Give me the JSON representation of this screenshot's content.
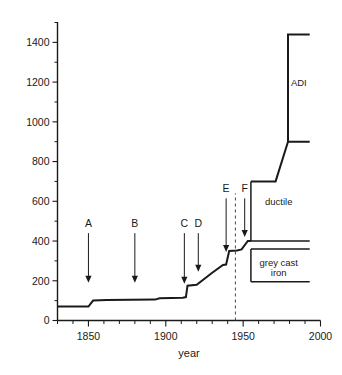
{
  "chart_data": {
    "type": "line",
    "title": "",
    "xlabel": "year",
    "ylabel": "",
    "xlim": [
      1830,
      2000
    ],
    "ylim": [
      0,
      1500
    ],
    "grid": false,
    "legend": "none",
    "x_ticks_major": [
      1850,
      1900,
      1950,
      2000
    ],
    "x_tick_labels": [
      "1850",
      "1900",
      "1950",
      "2000"
    ],
    "x_tick_minor_step": 10,
    "y_ticks_major": [
      0,
      200,
      400,
      600,
      800,
      1000,
      1200,
      1400
    ],
    "y_tick_labels": [
      "0",
      "200",
      "400",
      "600",
      "800",
      "1000",
      "1200",
      "1400"
    ],
    "y_tick_minor_step": 100,
    "series": [
      {
        "name": "tensile strength envelope",
        "points": [
          [
            1830,
            70
          ],
          [
            1850,
            70
          ],
          [
            1853,
            100
          ],
          [
            1862,
            103
          ],
          [
            1893,
            105
          ],
          [
            1896,
            112
          ],
          [
            1911,
            115
          ],
          [
            1913,
            118
          ],
          [
            1914,
            175
          ],
          [
            1920,
            180
          ],
          [
            1930,
            240
          ],
          [
            1937,
            280
          ],
          [
            1939,
            282
          ],
          [
            1941,
            350
          ],
          [
            1946,
            353
          ],
          [
            1949,
            358
          ],
          [
            1953,
            400
          ],
          [
            1955,
            400
          ]
        ]
      },
      {
        "name": "ductile upper bound",
        "points": [
          [
            1955,
            700
          ],
          [
            1971,
            700
          ],
          [
            1979,
            900
          ],
          [
            1993,
            900
          ]
        ]
      },
      {
        "name": "adi bound",
        "points": [
          [
            1979,
            900
          ],
          [
            1979,
            1440
          ],
          [
            1993,
            1440
          ]
        ]
      }
    ],
    "regions": [
      {
        "label": "ductile",
        "x": 1973,
        "y": 600
      },
      {
        "label": "grey  cast",
        "x": 1973,
        "y": 290
      },
      {
        "label": "iron",
        "x": 1973,
        "y": 240
      },
      {
        "label": "ADI",
        "x": 1986,
        "y": 1200
      }
    ],
    "region_boundaries": [
      {
        "name": "ductile-left-edge",
        "points": [
          [
            1955,
            700
          ],
          [
            1955,
            400
          ]
        ]
      },
      {
        "name": "ductile-bottom",
        "points": [
          [
            1955,
            400
          ],
          [
            1993,
            400
          ]
        ]
      },
      {
        "name": "grey-top",
        "points": [
          [
            1955,
            360
          ],
          [
            1993,
            360
          ]
        ]
      },
      {
        "name": "grey-left-edge",
        "points": [
          [
            1955,
            360
          ],
          [
            1955,
            195
          ]
        ]
      },
      {
        "name": "grey-bottom",
        "points": [
          [
            1955,
            195
          ],
          [
            1993,
            195
          ]
        ]
      },
      {
        "name": "adi-left-edge",
        "points": [
          [
            1979,
            1440
          ],
          [
            1979,
            900
          ]
        ]
      }
    ],
    "marker_line": {
      "name": "war-marker",
      "x": 1945,
      "style": "dashed",
      "y_from": 0,
      "y_to": 640
    },
    "annotations": [
      {
        "label": "A",
        "x": 1850,
        "label_y": 470,
        "tip_y": 190
      },
      {
        "label": "B",
        "x": 1880,
        "label_y": 470,
        "tip_y": 190
      },
      {
        "label": "C",
        "x": 1912,
        "label_y": 470,
        "tip_y": 185
      },
      {
        "label": "D",
        "x": 1921,
        "label_y": 470,
        "tip_y": 245
      },
      {
        "label": "E",
        "x": 1939,
        "label_y": 645,
        "tip_y": 345
      },
      {
        "label": "F",
        "x": 1951,
        "label_y": 645,
        "tip_y": 420
      }
    ]
  }
}
